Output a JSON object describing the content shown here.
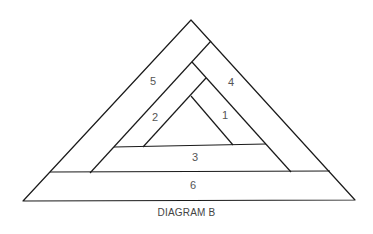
{
  "diagram": {
    "caption": "DIAGRAM B",
    "regions": [
      {
        "id": "1",
        "label": "1",
        "x": 225,
        "y": 115
      },
      {
        "id": "2",
        "label": "2",
        "x": 155,
        "y": 117
      },
      {
        "id": "3",
        "label": "3",
        "x": 195,
        "y": 157
      },
      {
        "id": "4",
        "label": "4",
        "x": 231,
        "y": 82
      },
      {
        "id": "5",
        "label": "5",
        "x": 153,
        "y": 81
      },
      {
        "id": "6",
        "label": "6",
        "x": 193,
        "y": 185
      }
    ],
    "stroke_color": "#1a1a1a"
  }
}
